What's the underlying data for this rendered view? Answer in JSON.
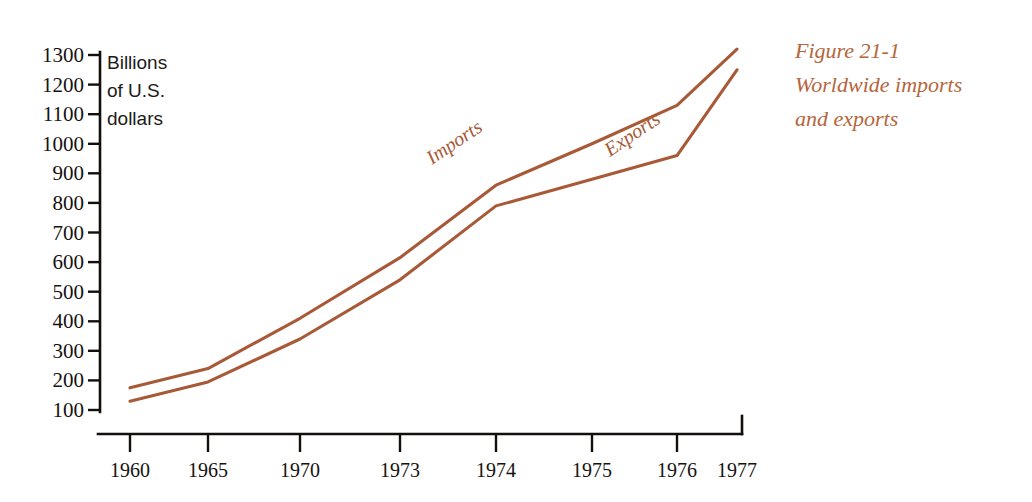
{
  "figure": {
    "caption_lines": [
      "Figure 21-1",
      "Worldwide imports",
      "and exports"
    ],
    "caption_color": "#b5653c",
    "axis_title_lines": [
      "Billions",
      "of U.S.",
      "dollars"
    ],
    "line_color": "#a85a38",
    "axis_color": "#120f0d"
  },
  "chart_data": {
    "type": "line",
    "title": "Figure 21-1 Worldwide imports and exports",
    "xlabel": "",
    "ylabel": "Billions of U.S. dollars",
    "categories": [
      "1960",
      "1965",
      "1970",
      "1973",
      "1974",
      "1975",
      "1976",
      "1977"
    ],
    "x_tick_labels": [
      "1960",
      "1965",
      "1970",
      "1973",
      "1974",
      "1975",
      "1976",
      "1977"
    ],
    "y_tick_labels": [
      "100",
      "200",
      "300",
      "400",
      "500",
      "600",
      "700",
      "800",
      "900",
      "1000",
      "1100",
      "1200",
      "1300"
    ],
    "y_ticks": [
      100,
      200,
      300,
      400,
      500,
      600,
      700,
      800,
      900,
      1000,
      1100,
      1200,
      1300
    ],
    "ylim": [
      100,
      1300
    ],
    "grid": false,
    "legend": "inline-labels",
    "series": [
      {
        "name": "Imports",
        "color": "#a85a38",
        "values": [
          175,
          240,
          410,
          615,
          860,
          1000,
          1130,
          1320
        ]
      },
      {
        "name": "Exports",
        "color": "#a85a38",
        "values": [
          130,
          195,
          340,
          540,
          790,
          880,
          960,
          1250
        ]
      }
    ],
    "annotations": [
      {
        "text": "Imports",
        "near_x": "1973",
        "rotation": -34
      },
      {
        "text": "Exports",
        "near_x": "1975",
        "rotation": -34
      }
    ]
  }
}
